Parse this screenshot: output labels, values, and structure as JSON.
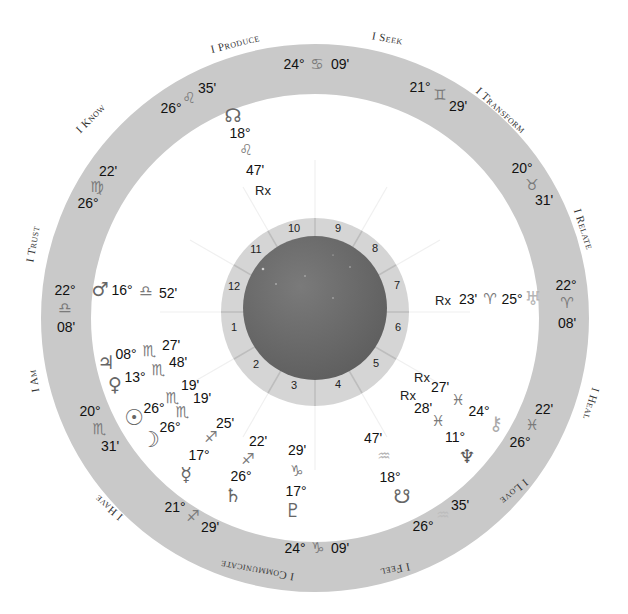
{
  "chart": {
    "center": {
      "x": 315,
      "y": 316
    },
    "colors": {
      "ring": "#c8c8c8",
      "house_ring": "#d6d6d6",
      "disc": "#6e6e6e",
      "glyph": "#7a7a7a",
      "text": "#111111"
    }
  },
  "themes": [
    {
      "label": "I Produce",
      "x": 243,
      "y": 44,
      "rot": -14
    },
    {
      "label": "I Seek",
      "x": 395,
      "y": 39,
      "rot": 10
    },
    {
      "label": "I Transform",
      "x": 508,
      "y": 112,
      "rot": 42
    },
    {
      "label": "I Relate",
      "x": 587,
      "y": 230,
      "rot": 72
    },
    {
      "label": "I Heal",
      "x": 594,
      "y": 406,
      "rot": 107
    },
    {
      "label": "I Love",
      "x": 519,
      "y": 493,
      "rot": 140
    },
    {
      "label": "I Feel",
      "x": 402,
      "y": 570,
      "rot": 168
    },
    {
      "label": "I Communicate",
      "x": 263,
      "y": 572,
      "rot": 190
    },
    {
      "label": "I Have",
      "x": 117,
      "y": 510,
      "rot": 220
    },
    {
      "label": "I Am",
      "x": 34,
      "y": 382,
      "rot": 260
    },
    {
      "label": "I Trust",
      "x": 34,
      "y": 245,
      "rot": -80
    },
    {
      "label": "I Know",
      "x": 95,
      "y": 120,
      "rot": -45
    }
  ],
  "cusps": [
    {
      "house": 10,
      "deg": "24°",
      "sign": "♋",
      "min": "09'"
    },
    {
      "house": 9,
      "deg": "21°",
      "sign": "♊",
      "min": "29'"
    },
    {
      "house": 8,
      "deg": "20°",
      "sign": "♉",
      "min": "31'"
    },
    {
      "house": 7,
      "deg": "22°",
      "sign": "♈",
      "min": "08'"
    },
    {
      "house": 6,
      "deg": "26°",
      "sign": "♓",
      "min": "22'"
    },
    {
      "house": 5,
      "deg": "26°",
      "sign": "♒",
      "min": "35'"
    },
    {
      "house": 4,
      "deg": "24°",
      "sign": "♑",
      "min": "09'"
    },
    {
      "house": 3,
      "deg": "21°",
      "sign": "♐",
      "min": "29'"
    },
    {
      "house": 2,
      "deg": "20°",
      "sign": "♏",
      "min": "31'"
    },
    {
      "house": 1,
      "deg": "22°",
      "sign": "♎",
      "min": "08'"
    },
    {
      "house": 12,
      "deg": "26°",
      "sign": "♍",
      "min": "22'"
    },
    {
      "house": 11,
      "deg": "26°",
      "sign": "♌",
      "min": "35'"
    }
  ],
  "houses": [
    "1",
    "2",
    "3",
    "4",
    "5",
    "6",
    "7",
    "8",
    "9",
    "10",
    "11",
    "12"
  ],
  "planets": [
    {
      "name": "North Node",
      "glyph": "☊",
      "deg": "18°",
      "sign": "♌",
      "min": "47'",
      "retro": "Rx"
    },
    {
      "name": "Uranus",
      "glyph": "♅",
      "deg": "25°",
      "sign": "♈",
      "min": "23'",
      "retro": "Rx"
    },
    {
      "name": "Mars",
      "glyph": "♂",
      "deg": "16°",
      "sign": "♎",
      "min": "52'"
    },
    {
      "name": "Jupiter",
      "glyph": "♃",
      "deg": "08°",
      "sign": "♏",
      "min": "27'"
    },
    {
      "name": "Venus",
      "glyph": "♀",
      "deg": "13°",
      "sign": "♏",
      "min": "48'"
    },
    {
      "name": "Sun",
      "glyph": "☉",
      "deg": "26°",
      "sign": "♏",
      "min": "19'"
    },
    {
      "name": "Moon",
      "glyph": "☽",
      "deg": "26°",
      "sign": "♏",
      "min": "19'"
    },
    {
      "name": "Mercury",
      "glyph": "☿",
      "deg": "17°",
      "sign": "♐",
      "min": "25'"
    },
    {
      "name": "Saturn",
      "glyph": "♄",
      "deg": "26°",
      "sign": "♐",
      "min": "22'"
    },
    {
      "name": "Pluto",
      "glyph": "♇",
      "deg": "17°",
      "sign": "♑",
      "min": "29'"
    },
    {
      "name": "South Node",
      "glyph": "☋",
      "deg": "18°",
      "sign": "♒",
      "min": "47'"
    },
    {
      "name": "Neptune",
      "glyph": "♆",
      "deg": "11°",
      "sign": "♓",
      "min": "28'",
      "retro": "Rx"
    },
    {
      "name": "Chiron",
      "glyph": "⚷",
      "deg": "24°",
      "sign": "♓",
      "min": "27'",
      "retro": "Rx"
    }
  ]
}
